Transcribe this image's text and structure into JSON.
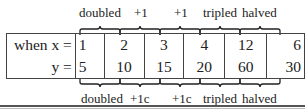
{
  "table": {
    "row_x_label": "when x =",
    "row_y_label": "y =",
    "x_values": [
      "1",
      "2",
      "3",
      "4",
      "12",
      "6"
    ],
    "y_values": [
      "5",
      "10",
      "15",
      "20",
      "60",
      "30"
    ]
  },
  "top_annotations": [
    "doubled",
    "+1",
    "+1",
    "tripled",
    "halved"
  ],
  "bottom_annotations": [
    "doubled",
    "+1c",
    "+1c",
    "tripled",
    "halved"
  ]
}
